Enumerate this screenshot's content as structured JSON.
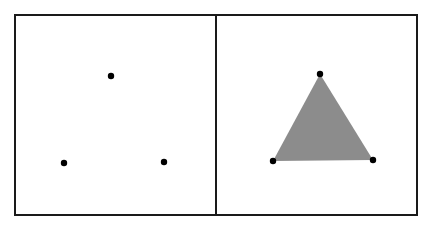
{
  "diagram": {
    "frame": {
      "x": 15,
      "y": 15,
      "width": 402,
      "height": 200,
      "stroke": "#1a1a1a",
      "stroke_width": 2
    },
    "divider": {
      "x": 216
    },
    "panels": [
      {
        "name": "points-only",
        "points": [
          {
            "x": 111,
            "y": 76
          },
          {
            "x": 64,
            "y": 163
          },
          {
            "x": 164,
            "y": 162
          }
        ]
      },
      {
        "name": "filled-triangle",
        "points": [
          {
            "x": 320,
            "y": 74
          },
          {
            "x": 273,
            "y": 161
          },
          {
            "x": 373,
            "y": 160
          }
        ],
        "fill": "#8c8c8c"
      }
    ],
    "point_radius": 3.2,
    "point_color": "#000000"
  }
}
